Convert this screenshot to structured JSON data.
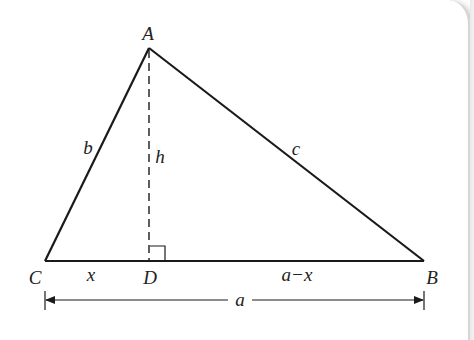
{
  "diagram": {
    "title": "",
    "type": "triangle with altitude",
    "vertices": {
      "A": {
        "label": "A",
        "x": 149,
        "y": 48
      },
      "B": {
        "label": "B",
        "x": 424,
        "y": 261
      },
      "C": {
        "label": "C",
        "x": 45,
        "y": 261
      },
      "D": {
        "label": "D",
        "x": 149,
        "y": 261
      }
    },
    "sides": {
      "b": "b",
      "c": "c",
      "h": "h"
    },
    "segments": {
      "CD": "x",
      "DB": "a−x"
    },
    "dimension": {
      "label": "a"
    },
    "colors": {
      "line": "#1a1a1a",
      "text": "#222222",
      "background": "#ffffff",
      "panel_edge": "#d6d6d6"
    }
  }
}
